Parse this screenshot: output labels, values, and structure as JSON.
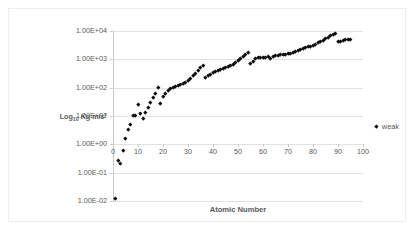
{
  "chart": {
    "type": "scatter",
    "title": "",
    "xlabel": "Atomic Number",
    "ylabel_html": "Log10 Kg m/s2",
    "ylabel_main": "Log",
    "ylabel_sub": "10",
    "ylabel_rest": " Kg m/s²",
    "legend_label": "weak",
    "legend_position": "right",
    "grid": "horizontal",
    "marker_color": "#0d0d0d",
    "gridline_color": "#e2e2e2",
    "axis_color": "#c9c9c9",
    "text_color": "#58595b",
    "background": "#ffffff",
    "border_color": "#ededed",
    "xlim": [
      0,
      100
    ],
    "ylim_log": [
      -2,
      4
    ],
    "xticks": [
      0,
      10,
      20,
      30,
      40,
      50,
      60,
      70,
      80,
      90,
      100
    ],
    "xtick_labels": [
      "0",
      "10",
      "20",
      "30",
      "40",
      "50",
      "60",
      "70",
      "80",
      "90",
      "100"
    ],
    "yticks_log": [
      4,
      3,
      2,
      1,
      0,
      -1,
      -2
    ],
    "ytick_labels": [
      "1.00E+04",
      "1.00E+03",
      "1.00E+02",
      "1.00E+01",
      "1.00E+00",
      "1.00E-01",
      "1.00E-02"
    ]
  },
  "chart_data": {
    "type": "scatter",
    "title": "",
    "xlabel": "Atomic Number",
    "ylabel": "Log10 Kg m/s2",
    "ylim": [
      0.01,
      10000
    ],
    "xlim": [
      0,
      100
    ],
    "yscale": "log",
    "grid": true,
    "legend": [
      "weak"
    ],
    "series": [
      {
        "name": "weak",
        "x": [
          1,
          2,
          3,
          4,
          5,
          6,
          7,
          8,
          9,
          10,
          11,
          12,
          13,
          14,
          15,
          16,
          17,
          18,
          19,
          20,
          21,
          22,
          23,
          24,
          25,
          26,
          27,
          28,
          29,
          30,
          31,
          32,
          33,
          34,
          35,
          36,
          37,
          38,
          39,
          40,
          41,
          42,
          43,
          44,
          45,
          46,
          47,
          48,
          49,
          50,
          51,
          52,
          53,
          54,
          55,
          56,
          57,
          58,
          59,
          60,
          61,
          62,
          63,
          64,
          65,
          66,
          67,
          68,
          69,
          70,
          71,
          72,
          73,
          74,
          75,
          76,
          77,
          78,
          79,
          80,
          81,
          82,
          83,
          84,
          85,
          86,
          87,
          88,
          89,
          90,
          91,
          92,
          93,
          94,
          95
        ],
        "y": [
          0.012,
          0.28,
          0.21,
          0.62,
          1.6,
          3.4,
          5.2,
          10.5,
          10.8,
          25.0,
          12.0,
          8.2,
          14.0,
          20.0,
          30.0,
          45.0,
          62.0,
          105.0,
          29.0,
          48.0,
          62.0,
          78.0,
          92.0,
          100.0,
          112.0,
          125.0,
          135.0,
          148.0,
          160.0,
          175.0,
          215.0,
          265.0,
          330.0,
          420.0,
          510.0,
          610.0,
          230.0,
          270.0,
          300.0,
          340.0,
          380.0,
          420.0,
          460.0,
          500.0,
          540.0,
          585.0,
          630.0,
          680.0,
          780.0,
          900.0,
          1050.0,
          1250.0,
          1450.0,
          1750.0,
          700.0,
          830.0,
          1100.0,
          1200.0,
          1150.0,
          1200.0,
          1180.0,
          1250.0,
          1100.0,
          1300.0,
          1350.0,
          1400.0,
          1450.0,
          1500.0,
          1550.0,
          1600.0,
          1700.0,
          1800.0,
          1950.0,
          2100.0,
          2250.0,
          2400.0,
          2600.0,
          2800.0,
          3000.0,
          3200.0,
          3500.0,
          3900.0,
          4300.0,
          4800.0,
          5400.0,
          6000.0,
          6800.0,
          7500.0,
          8200.0,
          4300.0,
          4500.0,
          4700.0,
          4900.0,
          5100.0,
          5300.0
        ]
      }
    ]
  }
}
